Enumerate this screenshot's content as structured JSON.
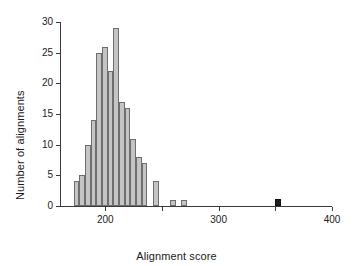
{
  "chart_data": {
    "type": "bar",
    "title": "",
    "xlabel": "Alignment score",
    "ylabel": "Number of alignments",
    "xlim": [
      160,
      400
    ],
    "ylim": [
      0,
      30
    ],
    "bin_width": 5,
    "grid": false,
    "legend": null,
    "xticks": [
      200,
      250,
      300,
      350,
      400
    ],
    "xtick_labels": [
      "200",
      "",
      "300",
      "",
      "400"
    ],
    "yticks": [
      0,
      5,
      10,
      15,
      20,
      25,
      30
    ],
    "ytick_labels": [
      "0",
      "5",
      "10",
      "15",
      "20",
      "25",
      "30"
    ],
    "bin_starts": [
      172,
      177,
      182,
      187,
      192,
      197,
      202,
      207,
      212,
      217,
      222,
      227,
      232,
      242,
      257,
      267,
      350
    ],
    "categories": [
      "172",
      "177",
      "182",
      "187",
      "192",
      "197",
      "202",
      "207",
      "212",
      "217",
      "222",
      "227",
      "232",
      "242",
      "257",
      "267",
      "350"
    ],
    "values": [
      4,
      5,
      10,
      14,
      25,
      26,
      22,
      29,
      17,
      16,
      11,
      8,
      7,
      4,
      1,
      1,
      1
    ],
    "highlight_index": 16,
    "colors": {
      "bar_fill": "#c4c4c4",
      "bar_edge": "#6e6e6e",
      "highlight_fill": "#1f1f1f",
      "axis": "#3a3a3a",
      "text": "#1a1a1a",
      "background": "#ffffff"
    }
  }
}
